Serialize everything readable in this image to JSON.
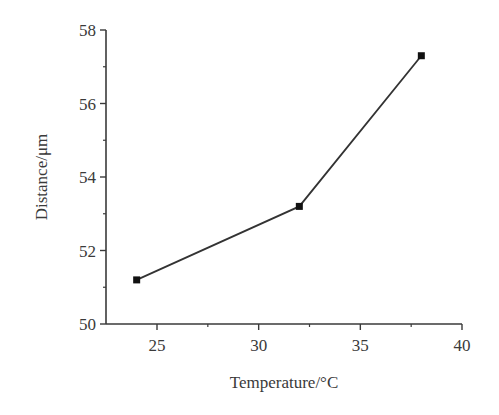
{
  "chart_data": {
    "type": "line",
    "title": "",
    "xlabel": "Temperature/°C",
    "ylabel": "Distance/μm",
    "xlim": [
      22.5,
      40
    ],
    "ylim": [
      50,
      58
    ],
    "x_ticks": [
      25,
      30,
      35,
      40
    ],
    "x_minor_ticks": [
      27.5,
      32.5,
      37.5
    ],
    "y_ticks": [
      50,
      52,
      54,
      56,
      58
    ],
    "y_minor_ticks": [
      51,
      53,
      55,
      57
    ],
    "x_tick_labels": [
      "25",
      "30",
      "35",
      "40"
    ],
    "y_tick_labels": [
      "50",
      "52",
      "54",
      "56",
      "58"
    ],
    "grid": false,
    "legend": null,
    "series": [
      {
        "name": "Distance",
        "marker": "square",
        "color": "#333333",
        "x": [
          24,
          32,
          38
        ],
        "y": [
          51.2,
          53.2,
          57.3
        ]
      }
    ]
  }
}
